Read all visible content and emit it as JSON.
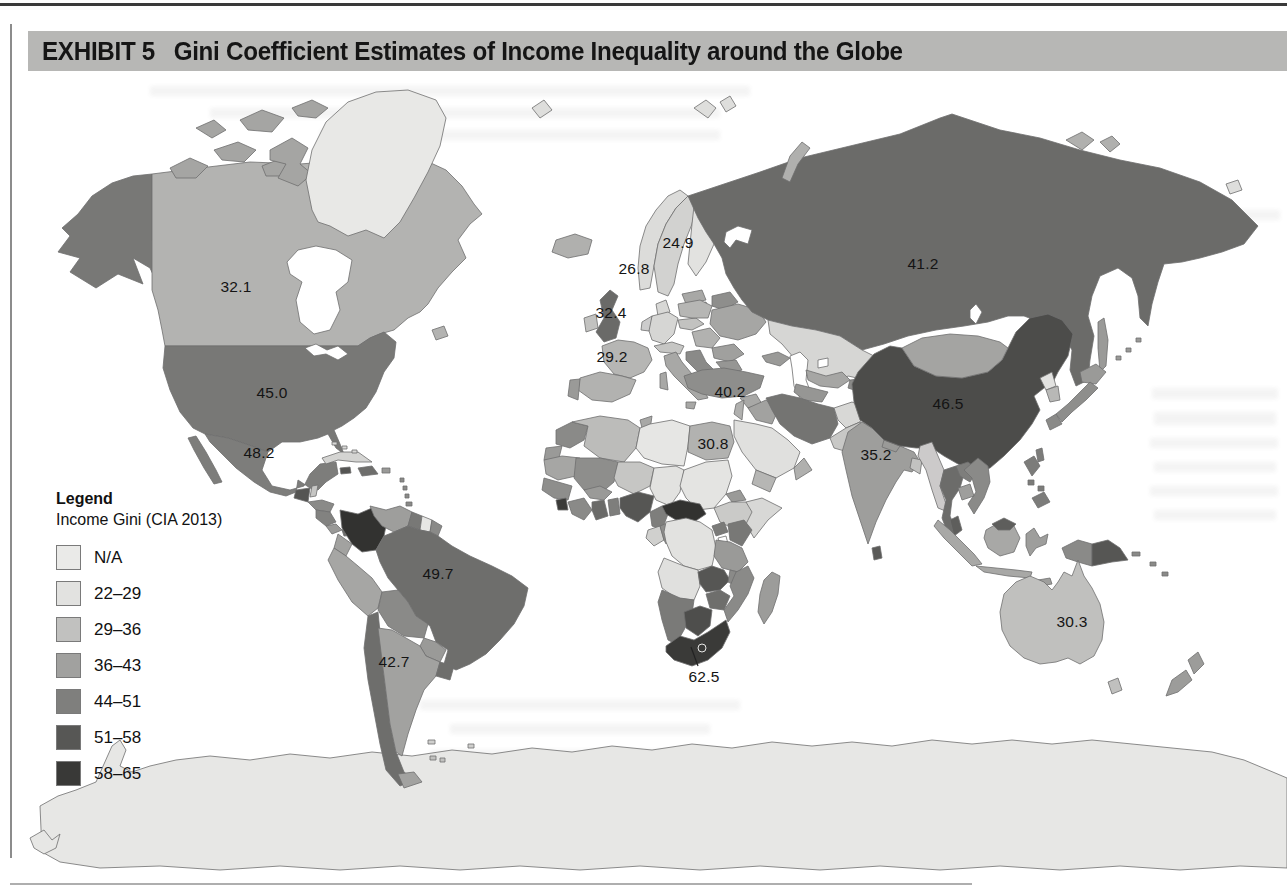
{
  "exhibit": {
    "label": "EXHIBIT 5",
    "title": "Gini Coefficient Estimates of Income Inequality around the Globe"
  },
  "legend": {
    "heading": "Legend",
    "subheading": "Income Gini (CIA 2013)",
    "bins": [
      {
        "label": "N/A",
        "color": "#eaeae8"
      },
      {
        "label": "22–29",
        "color": "#e2e2e0"
      },
      {
        "label": "29–36",
        "color": "#c1c1bf"
      },
      {
        "label": "36–43",
        "color": "#a1a19f"
      },
      {
        "label": "44–51",
        "color": "#7f7f7d"
      },
      {
        "label": "51–58",
        "color": "#575755"
      },
      {
        "label": "58–65",
        "color": "#393937"
      }
    ]
  },
  "chart_data": {
    "type": "choropleth_map",
    "title": "Gini Coefficient Estimates of Income Inequality around the Globe",
    "legend_title": "Income Gini (CIA 2013)",
    "bins": [
      "N/A",
      "22–29",
      "29–36",
      "36–43",
      "44–51",
      "51–58",
      "58–65"
    ],
    "bin_colors": [
      "#eaeae8",
      "#e2e2e0",
      "#c1c1bf",
      "#a1a19f",
      "#7f7f7d",
      "#575755",
      "#393937"
    ],
    "labeled_points": [
      {
        "name": "Canada",
        "value": 32.1
      },
      {
        "name": "United States",
        "value": 45.0
      },
      {
        "name": "Mexico",
        "value": 48.2
      },
      {
        "name": "Brazil",
        "value": 49.7
      },
      {
        "name": "Argentina",
        "value": 42.7
      },
      {
        "name": "Sweden",
        "value": 24.9
      },
      {
        "name": "Norway",
        "value": 26.8
      },
      {
        "name": "United Kingdom",
        "value": 32.4
      },
      {
        "name": "France",
        "value": 29.2
      },
      {
        "name": "Turkey",
        "value": 40.2
      },
      {
        "name": "Egypt",
        "value": 30.8
      },
      {
        "name": "Russia",
        "value": 41.2
      },
      {
        "name": "China",
        "value": 46.5
      },
      {
        "name": "India",
        "value": 35.2
      },
      {
        "name": "South Africa",
        "value": 62.5
      },
      {
        "name": "Australia",
        "value": 30.3
      }
    ]
  },
  "map": {
    "labels": [
      {
        "name": "canada",
        "text": "32.1",
        "x": 236,
        "y": 287
      },
      {
        "name": "united-states",
        "text": "45.0",
        "x": 272,
        "y": 393
      },
      {
        "name": "mexico",
        "text": "48.2",
        "x": 259,
        "y": 453
      },
      {
        "name": "brazil",
        "text": "49.7",
        "x": 438,
        "y": 574
      },
      {
        "name": "argentina",
        "text": "42.7",
        "x": 394,
        "y": 662
      },
      {
        "name": "sweden",
        "text": "24.9",
        "x": 678,
        "y": 243
      },
      {
        "name": "norway",
        "text": "26.8",
        "x": 634,
        "y": 269
      },
      {
        "name": "united-kingdom",
        "text": "32.4",
        "x": 611,
        "y": 313
      },
      {
        "name": "france",
        "text": "29.2",
        "x": 612,
        "y": 357
      },
      {
        "name": "turkey",
        "text": "40.2",
        "x": 730,
        "y": 392
      },
      {
        "name": "egypt",
        "text": "30.8",
        "x": 713,
        "y": 444
      },
      {
        "name": "russia",
        "text": "41.2",
        "x": 923,
        "y": 264
      },
      {
        "name": "china",
        "text": "46.5",
        "x": 948,
        "y": 404
      },
      {
        "name": "india",
        "text": "35.2",
        "x": 876,
        "y": 455
      },
      {
        "name": "south-africa",
        "text": "62.5",
        "x": 704,
        "y": 677
      },
      {
        "name": "australia",
        "text": "30.3",
        "x": 1072,
        "y": 622
      }
    ]
  }
}
